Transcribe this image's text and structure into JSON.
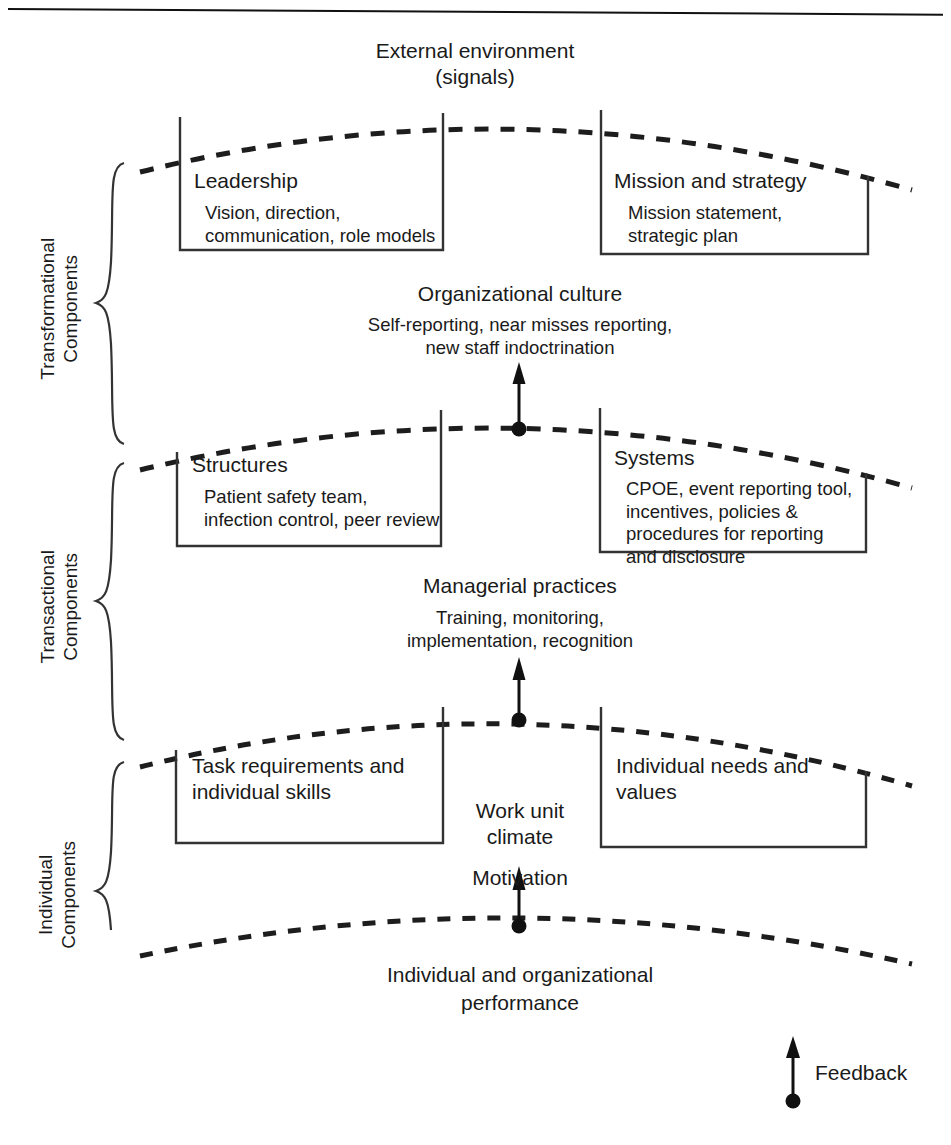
{
  "diagram": {
    "external": {
      "line1": "External environment",
      "line2": "(signals)"
    },
    "side_labels": [
      {
        "id": "transformational",
        "text": "Transformational\nComponents"
      },
      {
        "id": "transactional",
        "text": "Transactional\nComponents"
      },
      {
        "id": "individual",
        "text": "Individual\nComponents"
      }
    ],
    "levels": [
      {
        "id": "transformational",
        "left_box": {
          "heading": "Leadership",
          "detail": "Vision, direction,\ncommunication, role models"
        },
        "right_box": {
          "heading": "Mission and strategy",
          "detail": "Mission statement,\nstrategic plan"
        },
        "center": {
          "heading": "Organizational culture",
          "detail": "Self-reporting, near misses reporting,\nnew staff indoctrination"
        }
      },
      {
        "id": "transactional",
        "left_box": {
          "heading": "Structures",
          "detail": "Patient safety team,\ninfection control, peer review"
        },
        "right_box": {
          "heading": "Systems",
          "detail": "CPOE, event reporting tool,\nincentives, policies &\nprocedures for reporting\nand disclosure"
        },
        "center": {
          "heading": "Managerial practices",
          "detail": "Training, monitoring,\nimplementation, recognition"
        }
      },
      {
        "id": "individual",
        "left_box": {
          "heading": "Task requirements and\nindividual skills",
          "detail": ""
        },
        "right_box": {
          "heading": "Individual needs and\nvalues",
          "detail": ""
        },
        "center": {
          "heading": "Work unit\nclimate",
          "detail": ""
        }
      }
    ],
    "motivation_label": "Motivation",
    "performance": {
      "line1": "Individual and organizational",
      "line2": "performance"
    },
    "feedback_label": "Feedback",
    "colors": {
      "ink": "#1a1a1a",
      "line": "#222222",
      "background": "#ffffff"
    }
  }
}
